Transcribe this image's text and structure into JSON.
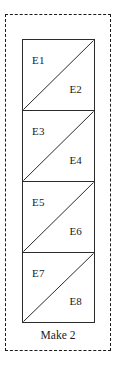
{
  "diagram": {
    "caption": "Make 2",
    "boundary_style": "dashed",
    "colors": {
      "line": "#2b2b2b",
      "boundary": "#1a1a1a",
      "text": "#1a1a1a",
      "fill": "#ffffff"
    },
    "units": [
      {
        "index": 1,
        "diagonal": "bottom-left-to-top-right",
        "upper_left_label": "E1",
        "lower_right_label": "E2"
      },
      {
        "index": 2,
        "diagonal": "bottom-left-to-top-right",
        "upper_left_label": "E3",
        "lower_right_label": "E4"
      },
      {
        "index": 3,
        "diagonal": "bottom-left-to-top-right",
        "upper_left_label": "E5",
        "lower_right_label": "E6"
      },
      {
        "index": 4,
        "diagonal": "bottom-left-to-top-right",
        "upper_left_label": "E7",
        "lower_right_label": "E8"
      }
    ]
  }
}
